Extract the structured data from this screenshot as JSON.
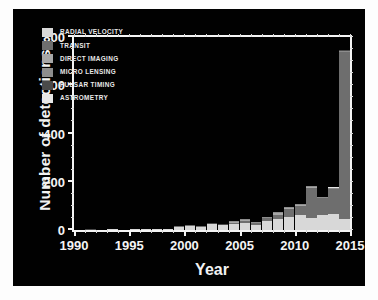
{
  "chart_data": {
    "type": "bar",
    "stacked": true,
    "title": "",
    "xlabel": "Year",
    "ylabel": "Number of detections",
    "xlim": [
      1990,
      2015
    ],
    "ylim": [
      0,
      800
    ],
    "ytick_labels": [
      "0",
      "200",
      "400",
      "600",
      "800"
    ],
    "ytick_values": [
      0,
      200,
      400,
      600,
      800
    ],
    "xtick_labels": [
      "1990",
      "1995",
      "2000",
      "2005",
      "2010",
      "2015"
    ],
    "xtick_values": [
      1990,
      1995,
      2000,
      2005,
      2010,
      2015
    ],
    "grid": false,
    "legend_position": "upper-left",
    "categories": [
      1989,
      1990,
      1991,
      1992,
      1993,
      1994,
      1995,
      1996,
      1997,
      1998,
      1999,
      2000,
      2001,
      2002,
      2003,
      2004,
      2005,
      2006,
      2007,
      2008,
      2009,
      2010,
      2011,
      2012,
      2013,
      2014
    ],
    "series": [
      {
        "name": "RADIAL VELOCITY",
        "color": "#d8d8d8",
        "values": [
          0,
          0,
          0,
          0,
          1,
          0,
          1,
          6,
          1,
          5,
          13,
          16,
          12,
          24,
          20,
          25,
          30,
          21,
          36,
          45,
          54,
          62,
          50,
          62,
          66,
          47
        ]
      },
      {
        "name": "TRANSIT",
        "color": "#6e6e6e",
        "values": [
          0,
          0,
          0,
          0,
          0,
          0,
          0,
          0,
          0,
          0,
          1,
          1,
          1,
          1,
          2,
          5,
          8,
          8,
          12,
          18,
          34,
          36,
          123,
          69,
          103,
          690
        ]
      },
      {
        "name": "DIRECT IMAGING",
        "color": "#a7a7a7",
        "values": [
          0,
          0,
          0,
          0,
          0,
          0,
          0,
          0,
          0,
          0,
          0,
          0,
          0,
          0,
          0,
          2,
          2,
          1,
          3,
          7,
          4,
          4,
          4,
          3,
          3,
          2
        ]
      },
      {
        "name": "MICRO LENSING",
        "color": "#8d8d8d",
        "values": [
          0,
          0,
          0,
          0,
          0,
          0,
          0,
          0,
          0,
          0,
          0,
          0,
          0,
          0,
          0,
          1,
          3,
          3,
          4,
          6,
          5,
          6,
          3,
          2,
          3,
          2
        ]
      },
      {
        "name": "PULSAR TIMING",
        "color": "#4a4a4a",
        "values": [
          0,
          0,
          2,
          0,
          0,
          0,
          0,
          0,
          0,
          0,
          0,
          0,
          0,
          1,
          1,
          0,
          0,
          0,
          0,
          0,
          0,
          0,
          0,
          0,
          0,
          1
        ]
      },
      {
        "name": "ASTROMETRY",
        "color": "#e8e8e8",
        "values": [
          0,
          0,
          0,
          0,
          0,
          0,
          0,
          0,
          0,
          0,
          0,
          0,
          0,
          0,
          0,
          0,
          0,
          0,
          0,
          0,
          0,
          0,
          0,
          0,
          1,
          0
        ]
      }
    ],
    "totals": [
      0,
      0,
      2,
      0,
      1,
      0,
      1,
      6,
      1,
      5,
      14,
      17,
      13,
      26,
      23,
      33,
      43,
      33,
      55,
      76,
      97,
      108,
      180,
      136,
      176,
      742
    ]
  },
  "style": {
    "background": "#010101",
    "paper": "#fdfdfd",
    "foreground": "#f4f4f4"
  }
}
